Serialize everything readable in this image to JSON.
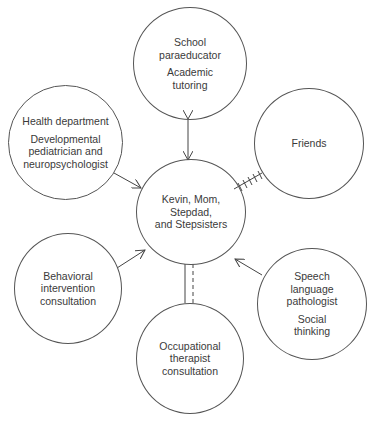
{
  "diagram": {
    "type": "ecomap",
    "center": {
      "id": "family",
      "lines": [
        "Kevin, Mom,",
        "Stepdad,",
        "and Stepsisters"
      ]
    },
    "nodes": [
      {
        "id": "school",
        "title_lines": [
          "School",
          "paraeducator"
        ],
        "detail_lines": [
          "Academic",
          "tutoring"
        ],
        "connection": "bidirectional-arrow"
      },
      {
        "id": "health",
        "title_lines": [
          "Health department"
        ],
        "detail_lines": [
          "Developmental",
          "pediatrician and",
          "neuropsychologist"
        ],
        "connection": "arrow-to-center"
      },
      {
        "id": "friends",
        "title_lines": [
          "Friends"
        ],
        "detail_lines": [],
        "connection": "stressful-hatched"
      },
      {
        "id": "behavioral",
        "title_lines": [
          "Behavioral",
          "intervention",
          "consultation"
        ],
        "detail_lines": [],
        "connection": "arrow-to-center"
      },
      {
        "id": "speech",
        "title_lines": [
          "Speech",
          "language",
          "pathologist"
        ],
        "detail_lines": [
          "Social",
          "thinking"
        ],
        "connection": "arrow-to-center"
      },
      {
        "id": "occupational",
        "title_lines": [
          "Occupational",
          "therapist",
          "consultation"
        ],
        "detail_lines": [],
        "connection": "solid-and-dashed"
      }
    ]
  }
}
